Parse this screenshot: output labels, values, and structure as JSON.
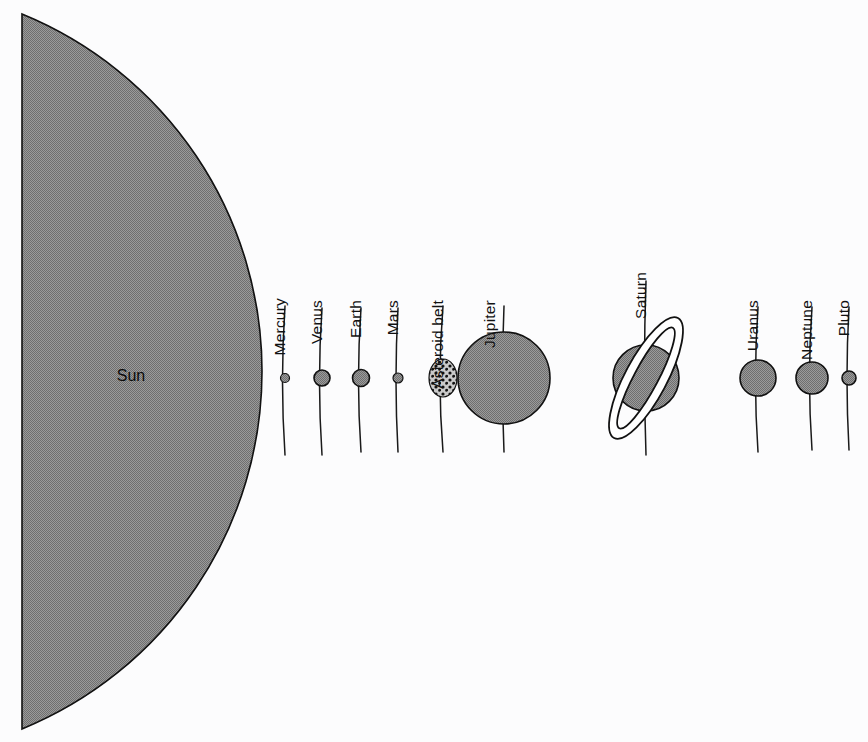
{
  "figure": {
    "background_color": "#fcfcfd",
    "body_fill_color": "#8a8a8a",
    "outline_color": "#111111"
  },
  "sun": {
    "label": "Sun",
    "label_x": 131,
    "label_y": 381,
    "flat_edge_x": 22,
    "top_y": 14,
    "bottom_y": 729,
    "bulge_x": 262,
    "center_y": 378
  },
  "chart_data": {
    "type": "scatter",
    "xlabel": "",
    "ylabel": "",
    "orientation": "horizontal",
    "baseline_y": 378,
    "categories": [
      "Sun",
      "Mercury",
      "Venus",
      "Earth",
      "Mars",
      "Asteroid belt",
      "Jupiter",
      "Saturn",
      "Uranus",
      "Neptune",
      "Pluto"
    ],
    "values": [
      262,
      4.5,
      8,
      8.5,
      5,
      14,
      46,
      33,
      18,
      16,
      7
    ],
    "note": "values are drawn radii in pixels; Sun value is the arc bulge half-width"
  },
  "bodies": [
    {
      "name": "Mercury",
      "label": "Mercury",
      "shape": "circle",
      "cx": 285,
      "cy": 378,
      "r": 4.5,
      "label_x": 285,
      "label_y": 298,
      "leader": {
        "top_y": 306,
        "bottom_y": 455,
        "bow": 5
      }
    },
    {
      "name": "Venus",
      "label": "Venus",
      "shape": "circle",
      "cx": 322,
      "cy": 378,
      "r": 8,
      "label_x": 322,
      "label_y": 300,
      "leader": {
        "top_y": 308,
        "bottom_y": 455,
        "bow": 5
      }
    },
    {
      "name": "Earth",
      "label": "Earth",
      "shape": "circle",
      "cx": 361,
      "cy": 378,
      "r": 8.5,
      "label_x": 361,
      "label_y": 300,
      "leader": {
        "top_y": 308,
        "bottom_y": 452,
        "bow": 5
      }
    },
    {
      "name": "Mars",
      "label": "Mars",
      "shape": "circle",
      "cx": 398,
      "cy": 378,
      "r": 5,
      "label_x": 398,
      "label_y": 300,
      "leader": {
        "top_y": 308,
        "bottom_y": 452,
        "bow": 4
      }
    },
    {
      "name": "Asteroid belt",
      "label": "Asteroid belt",
      "shape": "stippled-oval",
      "cx": 443,
      "cy": 378,
      "rx": 14,
      "ry": 19,
      "label_x": 443,
      "label_y": 300,
      "leader": {
        "top_y": 306,
        "bottom_y": 452,
        "bow": 6
      }
    },
    {
      "name": "Jupiter",
      "label": "Jupiter",
      "shape": "circle",
      "cx": 504,
      "cy": 378,
      "r": 46,
      "label_x": 495,
      "label_y": 300,
      "leader": {
        "top_y": 306,
        "bottom_y": 452,
        "bow": 3
      }
    },
    {
      "name": "Saturn",
      "label": "Saturn",
      "shape": "ringed-circle",
      "cx": 646,
      "cy": 378,
      "r": 33,
      "ring_rx": 68,
      "ring_ry": 21,
      "ring_inner_rx": 57,
      "ring_inner_ry": 12,
      "ring_rotation": -62,
      "label_x": 646,
      "label_y": 272,
      "leader": {
        "top_y": 281,
        "bottom_y": 455,
        "bow": 3
      }
    },
    {
      "name": "Uranus",
      "label": "Uranus",
      "shape": "circle",
      "cx": 758,
      "cy": 378,
      "r": 18,
      "label_x": 758,
      "label_y": 300,
      "leader": {
        "top_y": 307,
        "bottom_y": 452,
        "bow": 5
      }
    },
    {
      "name": "Neptune",
      "label": "Neptune",
      "shape": "circle",
      "cx": 812,
      "cy": 378,
      "r": 16,
      "label_x": 812,
      "label_y": 300,
      "leader": {
        "top_y": 307,
        "bottom_y": 450,
        "bow": 5
      }
    },
    {
      "name": "Pluto",
      "label": "Pluto",
      "shape": "circle",
      "cx": 849,
      "cy": 378,
      "r": 7,
      "label_x": 849,
      "label_y": 300,
      "leader": {
        "top_y": 307,
        "bottom_y": 450,
        "bow": 4
      }
    }
  ]
}
